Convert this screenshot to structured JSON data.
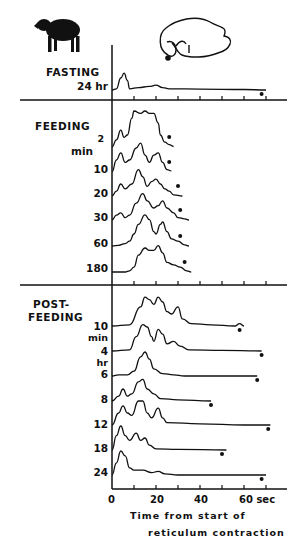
{
  "chart_data": {
    "type": "line",
    "title": "",
    "xlabel": "Time from start of reticulum contraction",
    "xlabel_lines": [
      "Time  from  start  of",
      "reticulum  contraction"
    ],
    "ylabel": "",
    "x_ticks": [
      "0",
      "20",
      "40",
      "60 sec"
    ],
    "x_unit": "sec",
    "xlim": [
      0,
      72
    ],
    "x_tick_interval": 10,
    "grid": false,
    "legend": "none",
    "icons": [
      "sheep-silhouette",
      "stomach-diagram-reticulum-marked"
    ],
    "groups": [
      {
        "name": "FASTING",
        "series": [
          {
            "name": "24 hr",
            "label": "24 hr",
            "end_marker_sec": 68,
            "peaks_sec": [
              6,
              20
            ],
            "trace": [
              [
                0,
                0
              ],
              [
                2,
                0.5
              ],
              [
                4,
                5
              ],
              [
                5.5,
                7
              ],
              [
                7,
                4
              ],
              [
                8,
                0.5
              ],
              [
                12,
                1
              ],
              [
                17,
                1.5
              ],
              [
                20,
                2
              ],
              [
                23,
                1
              ],
              [
                26,
                0.5
              ],
              [
                40,
                0.4
              ],
              [
                60,
                0.2
              ],
              [
                70,
                0
              ]
            ]
          }
        ]
      },
      {
        "name": "FEEDING",
        "series": [
          {
            "name": "2 min",
            "label": "2",
            "end_marker_sec": 26,
            "trace": [
              [
                0,
                0
              ],
              [
                2,
                3
              ],
              [
                4,
                7
              ],
              [
                5.5,
                4
              ],
              [
                7,
                5
              ],
              [
                9,
                12
              ],
              [
                10,
                15
              ],
              [
                13,
                14
              ],
              [
                15,
                15
              ],
              [
                17,
                14
              ],
              [
                19,
                14
              ],
              [
                21,
                10
              ],
              [
                22,
                5
              ],
              [
                24,
                2
              ],
              [
                26,
                1
              ],
              [
                28,
                0.2
              ]
            ]
          },
          {
            "name": "10 min",
            "label": "min",
            "end_marker_sec": 26,
            "trace": [
              [
                0,
                0
              ],
              [
                2,
                5
              ],
              [
                4,
                8
              ],
              [
                6,
                4
              ],
              [
                8,
                5
              ],
              [
                11,
                10
              ],
              [
                13,
                12
              ],
              [
                15,
                7
              ],
              [
                17,
                4
              ],
              [
                19,
                7
              ],
              [
                21,
                8
              ],
              [
                23,
                4
              ],
              [
                25,
                1
              ],
              [
                27,
                0.5
              ]
            ]
          },
          {
            "name": "10",
            "label": "10",
            "end_marker_sec": 30,
            "trace": [
              [
                0,
                0
              ],
              [
                2,
                2
              ],
              [
                4,
                5
              ],
              [
                6,
                3
              ],
              [
                9,
                5
              ],
              [
                12,
                11
              ],
              [
                14,
                8
              ],
              [
                16,
                4
              ],
              [
                18,
                6
              ],
              [
                20,
                7
              ],
              [
                22,
                5
              ],
              [
                24,
                3
              ],
              [
                26,
                2
              ],
              [
                28,
                0.5
              ],
              [
                32,
                0
              ]
            ]
          },
          {
            "name": "20",
            "label": "20",
            "end_marker_sec": 31,
            "trace": [
              [
                0,
                0
              ],
              [
                2,
                2
              ],
              [
                4,
                3
              ],
              [
                6,
                1
              ],
              [
                8,
                2
              ],
              [
                11,
                7
              ],
              [
                14,
                11
              ],
              [
                16,
                8
              ],
              [
                19,
                5
              ],
              [
                21,
                6
              ],
              [
                23,
                8
              ],
              [
                25,
                5
              ],
              [
                28,
                3
              ],
              [
                30,
                1
              ],
              [
                33,
                0.5
              ],
              [
                35,
                0
              ]
            ]
          },
          {
            "name": "30",
            "label": "30",
            "end_marker_sec": 31,
            "trace": [
              [
                0,
                0
              ],
              [
                3,
                0.3
              ],
              [
                6,
                1
              ],
              [
                8,
                2
              ],
              [
                10,
                5
              ],
              [
                12,
                9
              ],
              [
                15,
                13
              ],
              [
                17,
                11
              ],
              [
                19,
                6
              ],
              [
                20,
                5
              ],
              [
                22,
                9
              ],
              [
                23,
                10
              ],
              [
                25,
                6
              ],
              [
                27,
                3
              ],
              [
                30,
                2
              ],
              [
                33,
                0.5
              ],
              [
                35,
                0
              ]
            ]
          },
          {
            "name": "60",
            "label": "60",
            "end_marker_sec": 33,
            "trace": [
              [
                0,
                0
              ],
              [
                6,
                0
              ],
              [
                8,
                0.5
              ],
              [
                10,
                2
              ],
              [
                12,
                7
              ],
              [
                15,
                10
              ],
              [
                17,
                9
              ],
              [
                19,
                9
              ],
              [
                21,
                11
              ],
              [
                23,
                8
              ],
              [
                25,
                4
              ],
              [
                28,
                3
              ],
              [
                31,
                2
              ],
              [
                34,
                0.5
              ],
              [
                36,
                0
              ]
            ]
          },
          {
            "name": "180",
            "label": "180",
            "end_marker_sec": 36,
            "trace": [
              [
                0,
                0
              ],
              [
                4,
                0.5
              ],
              [
                7,
                0
              ],
              [
                10,
                1
              ],
              [
                13,
                7
              ],
              [
                15,
                9
              ],
              [
                18,
                8
              ],
              [
                21,
                10
              ],
              [
                23,
                10
              ],
              [
                25,
                6
              ],
              [
                28,
                3
              ],
              [
                31,
                2
              ],
              [
                33,
                3
              ],
              [
                35,
                1
              ],
              [
                37,
                0
              ]
            ]
          }
        ]
      },
      {
        "name": "POST-FEEDING",
        "series": [
          {
            "name": "10 min",
            "label": "10",
            "sublabel": "min",
            "end_marker_sec": 58,
            "peaks_sec": [
              15,
              22,
              30
            ],
            "trace": [
              [
                0,
                0
              ],
              [
                8,
                0.5
              ],
              [
                13,
                8
              ],
              [
                15,
                12
              ],
              [
                17,
                11
              ],
              [
                19,
                9
              ],
              [
                21,
                12
              ],
              [
                23,
                10
              ],
              [
                25,
                6
              ],
              [
                27,
                5
              ],
              [
                30,
                8
              ],
              [
                32,
                3
              ],
              [
                36,
                1
              ],
              [
                45,
                0.5
              ],
              [
                56,
                0
              ],
              [
                58,
                1
              ],
              [
                60,
                0
              ]
            ]
          },
          {
            "name": "4 hr",
            "label": "4",
            "sublabel": "hr",
            "end_marker_sec": 68,
            "peaks_sec": [
              15,
              21,
              28
            ],
            "trace": [
              [
                0,
                0
              ],
              [
                8,
                0.5
              ],
              [
                11,
                6
              ],
              [
                14,
                11
              ],
              [
                16,
                10
              ],
              [
                18,
                6
              ],
              [
                19,
                4
              ],
              [
                21,
                9
              ],
              [
                23,
                7
              ],
              [
                25,
                3
              ],
              [
                28,
                4
              ],
              [
                31,
                2
              ],
              [
                35,
                0.5
              ],
              [
                50,
                0.3
              ],
              [
                68,
                0
              ]
            ]
          },
          {
            "name": "6",
            "label": "6",
            "end_marker_sec": 66,
            "peaks_sec": [
              15
            ],
            "trace": [
              [
                0,
                0
              ],
              [
                3,
                0.5
              ],
              [
                7,
                0.5
              ],
              [
                10,
                2
              ],
              [
                13,
                8
              ],
              [
                15,
                10
              ],
              [
                17,
                7
              ],
              [
                19,
                3
              ],
              [
                23,
                1
              ],
              [
                28,
                0.5
              ],
              [
                33,
                0
              ],
              [
                50,
                0
              ],
              [
                66,
                0
              ]
            ]
          },
          {
            "name": "8",
            "label": "8",
            "end_marker_sec": 45,
            "peaks_sec": [
              5,
              13,
              19
            ],
            "trace": [
              [
                0,
                0
              ],
              [
                3,
                2
              ],
              [
                5,
                5
              ],
              [
                7,
                2
              ],
              [
                9,
                3
              ],
              [
                12,
                8
              ],
              [
                14,
                9
              ],
              [
                16,
                5
              ],
              [
                19,
                3
              ],
              [
                22,
                1
              ],
              [
                30,
                0.5
              ],
              [
                45,
                0
              ]
            ]
          },
          {
            "name": "12",
            "label": "12",
            "end_marker_sec": 71,
            "peaks_sec": [
              5,
              13,
              21
            ],
            "trace": [
              [
                0,
                0
              ],
              [
                3,
                5
              ],
              [
                5,
                8
              ],
              [
                7,
                5
              ],
              [
                9,
                4
              ],
              [
                12,
                10
              ],
              [
                14,
                10
              ],
              [
                16,
                5
              ],
              [
                18,
                3
              ],
              [
                21,
                7
              ],
              [
                23,
                3
              ],
              [
                25,
                1
              ],
              [
                40,
                0.5
              ],
              [
                60,
                0
              ],
              [
                72,
                0
              ]
            ]
          },
          {
            "name": "18",
            "label": "18",
            "end_marker_sec": 50,
            "peaks_sec": [
              5,
              11,
              16
            ],
            "trace": [
              [
                0,
                0
              ],
              [
                2,
                6
              ],
              [
                4,
                10
              ],
              [
                6,
                6
              ],
              [
                8,
                4
              ],
              [
                11,
                7
              ],
              [
                13,
                4
              ],
              [
                15,
                5
              ],
              [
                17,
                2
              ],
              [
                20,
                0.5
              ],
              [
                30,
                0.3
              ],
              [
                52,
                0
              ]
            ]
          },
          {
            "name": "24",
            "label": "24",
            "end_marker_sec": 68,
            "peaks_sec": [
              5
            ],
            "trace": [
              [
                0,
                0
              ],
              [
                2,
                5
              ],
              [
                4,
                10
              ],
              [
                6,
                8
              ],
              [
                8,
                3
              ],
              [
                10,
                2
              ],
              [
                14,
                2
              ],
              [
                18,
                1
              ],
              [
                21,
                1.5
              ],
              [
                24,
                0.5
              ],
              [
                30,
                0
              ],
              [
                70,
                0
              ]
            ]
          }
        ]
      }
    ]
  },
  "labels": {
    "fasting": "FASTING",
    "fasting_24": "24 hr",
    "feeding": "FEEDING",
    "feed_2": "2",
    "feed_min": "min",
    "feed_10": "10",
    "feed_20": "20",
    "feed_30": "30",
    "feed_60": "60",
    "feed_180": "180",
    "post1": "POST-",
    "post2": "FEEDING",
    "post_10": "10",
    "post_min": "min",
    "post_4": "4",
    "post_hr": "hr",
    "post_6": "6",
    "post_8": "8",
    "post_12": "12",
    "post_18": "18",
    "post_24": "24",
    "x0": "0",
    "x20": "20",
    "x40": "40",
    "x60": "60 sec",
    "cap1": "Time  from  start  of",
    "cap2": "reticulum  contraction"
  }
}
